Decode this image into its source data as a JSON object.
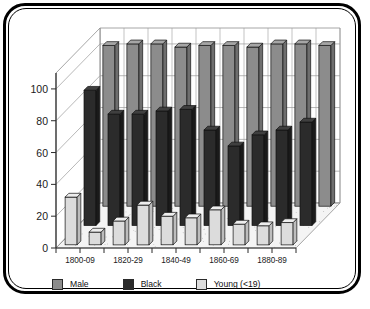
{
  "chart_data": {
    "type": "bar",
    "title": "",
    "subtitle": "",
    "xlabel": "",
    "ylabel": "",
    "ylim": [
      0,
      110
    ],
    "yticks": [
      0,
      20,
      40,
      60,
      80,
      100
    ],
    "grid": true,
    "projection": "3d",
    "legend_position": "bottom",
    "categories": [
      "1800-09",
      "1810-19",
      "1820-29",
      "1830-39",
      "1840-49",
      "1850-59",
      "1860-69",
      "1870-79",
      "1880-89",
      "1890-99"
    ],
    "tick_labels_shown": [
      "1800-09",
      "1820-29",
      "1840-49",
      "1860-69",
      "1880-89"
    ],
    "series": [
      {
        "name": "Male",
        "color": "#8c8c8c",
        "side_color": "#6e6e6e",
        "top_color": "#a6a6a6",
        "values": [
          101,
          102,
          102,
          100,
          101,
          101,
          100,
          102,
          102,
          101
        ]
      },
      {
        "name": "Black",
        "color": "#2b2b2b",
        "side_color": "#1a1a1a",
        "top_color": "#3f3f3f",
        "values": [
          85,
          70,
          70,
          72,
          73,
          60,
          50,
          57,
          60,
          65
        ]
      },
      {
        "name": "Young (<19)",
        "color": "#dcdcdc",
        "side_color": "#bdbdbd",
        "top_color": "#ededed",
        "values": [
          30,
          8,
          15,
          25,
          18,
          17,
          22,
          13,
          12,
          14
        ]
      }
    ]
  },
  "legend": {
    "items": [
      {
        "label": "Male",
        "color": "#8c8c8c"
      },
      {
        "label": "Black",
        "color": "#2b2b2b"
      },
      {
        "label": "Young (<19)",
        "color": "#dcdcdc"
      }
    ]
  },
  "axes": {
    "y_tick_labels": [
      "100",
      "80",
      "60",
      "40",
      "20",
      "0"
    ],
    "x_tick_labels": [
      "1800-09",
      "1820-29",
      "1840-49",
      "1860-69",
      "1880-89"
    ]
  },
  "colors": {
    "frame": "#000000",
    "background": "#ffffff",
    "floor": "#f2f2f2",
    "wall": "#ffffff",
    "gridline": "#9a9a9a"
  }
}
